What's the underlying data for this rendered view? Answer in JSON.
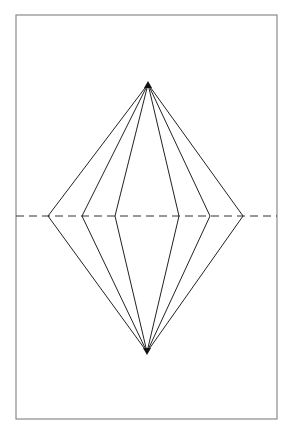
{
  "diagram": {
    "frame": {
      "x": 16,
      "y": 15,
      "width": 261,
      "height": 404,
      "stroke": "#8a8a8a"
    },
    "top_vertex": {
      "x": 148,
      "y": 84
    },
    "bottom_vertex": {
      "x": 147,
      "y": 352
    },
    "midline": {
      "y": 216,
      "x1": 16,
      "x2": 277,
      "dash": "8,5",
      "stroke": "#333333"
    },
    "fold_points": [
      {
        "x": 48,
        "y": 216
      },
      {
        "x": 82,
        "y": 216
      },
      {
        "x": 115,
        "y": 216
      },
      {
        "x": 179,
        "y": 216
      },
      {
        "x": 210,
        "y": 216
      },
      {
        "x": 243,
        "y": 216
      }
    ],
    "line_color": "#222222"
  }
}
